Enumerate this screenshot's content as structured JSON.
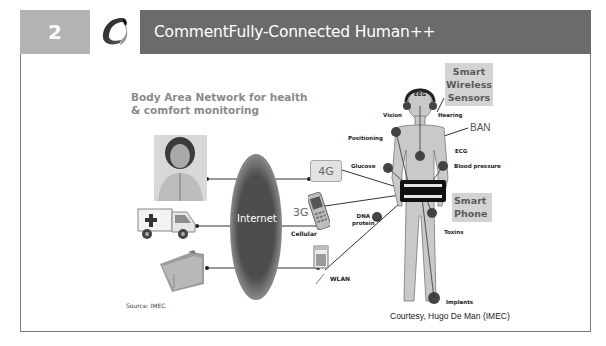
{
  "header": {
    "slide_number": "2",
    "title": "CommentFully-Connected Human++",
    "logo_icon": "swirl-logo-icon",
    "colors": {
      "number_block": "#b3b3b3",
      "title_bar": "#6b6b6b",
      "text": "#ffffff"
    }
  },
  "diagram": {
    "heading_line1": "Body Area Network for health",
    "heading_line2": "& comfort monitoring",
    "internet_label": "Internet",
    "left_nodes": [
      {
        "name": "patient-photo"
      },
      {
        "name": "ambulance"
      },
      {
        "name": "medical-records-folder"
      }
    ],
    "access_nodes": {
      "g4": "4G",
      "g3": "3G",
      "cellular": "Cellular",
      "wlan": "WLAN"
    },
    "body_sensors": {
      "eeg": "EEG",
      "vision": "Vision",
      "hearing": "Hearing",
      "positioning": "Positioning",
      "ecg": "ECG",
      "glucose": "Glucose",
      "blood_pressure": "Blood pressure",
      "dna_protein_1": "DNA",
      "dna_protein_2": "protein",
      "toxins": "Toxins",
      "implants": "Implants"
    },
    "ban_label": "BAN",
    "smart_sensors": {
      "line1": "Smart",
      "line2": "Wireless",
      "line3": "Sensors"
    },
    "smart_phone": {
      "line1": "Smart",
      "line2": "Phone"
    },
    "source": "Source: IMEC",
    "courtesy": "Courtesy, Hugo De Man (IMEC)"
  }
}
